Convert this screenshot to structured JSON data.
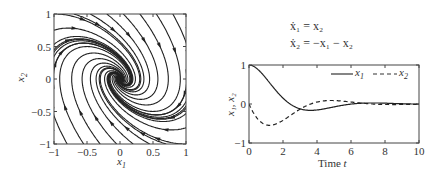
{
  "equations": {
    "line1": "ẋ₁ = x₂",
    "line2": "ẋ₂ = −x₁ − x₂"
  },
  "chart_data": [
    {
      "type": "phase_portrait",
      "title": "",
      "xlabel": "x1",
      "ylabel": "x2",
      "xlim": [
        -1,
        1
      ],
      "ylim": [
        -1,
        1
      ],
      "xticks": [
        "-1",
        "-0.5",
        "0",
        "0.5",
        "1"
      ],
      "yticks": [
        "-1",
        "-0.5",
        "0",
        "0.5",
        "1"
      ],
      "system": "dx1/dt = x2; dx2/dt = -x1 - x2",
      "equilibrium": [
        0,
        0
      ],
      "equilibrium_type": "stable focus",
      "grid": false
    },
    {
      "type": "line",
      "title": "",
      "xlabel": "Time t",
      "ylabel": "x1, x2",
      "xlim": [
        0,
        10
      ],
      "ylim": [
        -1,
        1
      ],
      "xticks": [
        "0",
        "2",
        "4",
        "6",
        "8",
        "10"
      ],
      "yticks": [
        "-1",
        "0",
        "1"
      ],
      "legend": [
        "x1",
        "x2"
      ],
      "legend_position": "upper right",
      "grid": false,
      "x": [
        0,
        0.5,
        1,
        1.5,
        2,
        2.5,
        3,
        3.5,
        4,
        4.5,
        5,
        6,
        7,
        8,
        9,
        10
      ],
      "series": [
        {
          "name": "x1",
          "style": "solid",
          "values": [
            1.0,
            0.89,
            0.66,
            0.4,
            0.17,
            0.0,
            -0.1,
            -0.15,
            -0.15,
            -0.12,
            -0.08,
            -0.01,
            0.02,
            0.02,
            0.01,
            0.0
          ]
        },
        {
          "name": "x2",
          "style": "dashed",
          "values": [
            0.0,
            -0.41,
            -0.53,
            -0.49,
            -0.4,
            -0.28,
            -0.15,
            -0.05,
            0.01,
            0.04,
            0.06,
            0.05,
            0.02,
            0.0,
            -0.01,
            -0.01
          ]
        }
      ]
    }
  ],
  "labels": {
    "phase_x": "x",
    "phase_x_sub": "1",
    "phase_y": "x",
    "phase_y_sub": "2",
    "time_x": "Time t",
    "time_y": "x₁, x₂",
    "legend_x1": "x",
    "legend_x1_sub": "1",
    "legend_x2": "x",
    "legend_x2_sub": "2"
  }
}
